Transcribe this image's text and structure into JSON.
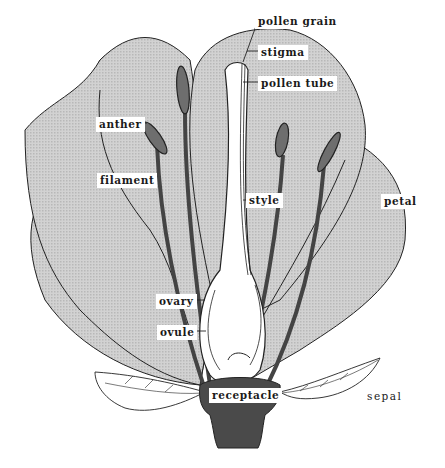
{
  "diagram": {
    "colors": {
      "petal_fill": "#c9c9c9",
      "outline": "#222222",
      "stamen_fill": "#6e6e6e",
      "receptacle_fill": "#4a4a4a",
      "pistil_fill": "#ffffff",
      "background": "#ffffff"
    },
    "labels": [
      {
        "id": "pollen-grain",
        "text": "pollen grain",
        "x": 255,
        "y": 14
      },
      {
        "id": "stigma",
        "text": "stigma",
        "x": 258,
        "y": 45
      },
      {
        "id": "pollen-tube",
        "text": "pollen tube",
        "x": 258,
        "y": 76
      },
      {
        "id": "anther",
        "text": "anther",
        "x": 96,
        "y": 117
      },
      {
        "id": "filament",
        "text": "filament",
        "x": 97,
        "y": 173
      },
      {
        "id": "style",
        "text": "style",
        "x": 246,
        "y": 193
      },
      {
        "id": "petal",
        "text": "petal",
        "x": 381,
        "y": 194
      },
      {
        "id": "ovary",
        "text": "ovary",
        "x": 156,
        "y": 294
      },
      {
        "id": "ovule",
        "text": "ovule",
        "x": 157,
        "y": 325
      },
      {
        "id": "receptacle",
        "text": "receptacle",
        "x": 209,
        "y": 388
      },
      {
        "id": "sepal",
        "text": "sepal",
        "x": 364,
        "y": 389
      }
    ]
  }
}
